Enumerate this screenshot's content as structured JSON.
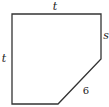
{
  "diagram": {
    "type": "pentagon",
    "stroke_color": "#333333",
    "vertices": [
      [
        12,
        14
      ],
      [
        101,
        14
      ],
      [
        101,
        59
      ],
      [
        58,
        104
      ],
      [
        12,
        104
      ]
    ],
    "labels": {
      "top": "t",
      "left": "t",
      "right": "s",
      "diagonal": "6"
    }
  }
}
